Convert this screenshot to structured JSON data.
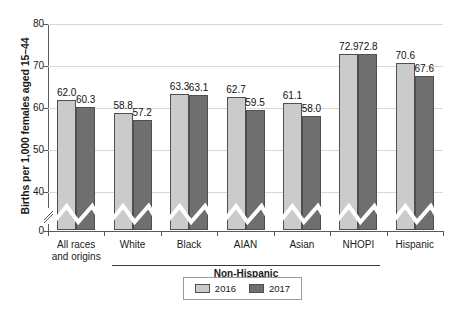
{
  "chart_data": {
    "type": "bar",
    "title": "",
    "xlabel": "",
    "ylabel": "Births per 1,000 females aged 15–44",
    "ylim": [
      0,
      80
    ],
    "yticks": [
      0,
      40,
      50,
      60,
      70,
      80
    ],
    "ytick_labels": [
      "0",
      "40",
      "50",
      "60",
      "70",
      "80"
    ],
    "axis_break": true,
    "axis_break_note": "y-axis broken between 0 and 40",
    "grid": true,
    "legend_position": "bottom-center",
    "categories": [
      "All races\nand origins",
      "White",
      "Black",
      "AIAN",
      "Asian",
      "NHOPI",
      "Hispanic"
    ],
    "category_labels": [
      "All races and origins",
      "White",
      "Black",
      "AIAN",
      "Asian",
      "NHOPI",
      "Hispanic"
    ],
    "group_bracket": {
      "label": "Non-Hispanic",
      "covers": [
        "White",
        "Black",
        "AIAN",
        "Asian",
        "NHOPI"
      ]
    },
    "series": [
      {
        "name": "2016",
        "color": "#cbcbcb",
        "values": [
          62.0,
          58.8,
          63.3,
          62.7,
          61.1,
          72.9,
          70.6
        ],
        "labels": [
          "62.0",
          "58.8",
          "63.3",
          "62.7",
          "61.1",
          "72.9",
          "70.6"
        ]
      },
      {
        "name": "2017",
        "color": "#6f6f6f",
        "values": [
          60.3,
          57.2,
          63.1,
          59.5,
          58.0,
          72.8,
          67.6
        ],
        "labels": [
          "60.3",
          "57.2",
          "63.1",
          "59.5",
          "58.0",
          "72.8",
          "67.6"
        ]
      }
    ]
  },
  "legend": {
    "items": [
      {
        "label": "2016",
        "color": "#cbcbcb"
      },
      {
        "label": "2017",
        "color": "#6f6f6f"
      }
    ]
  },
  "axis": {
    "y_title": "Births per 1,000 females aged 15–44",
    "y_tick_0": "0",
    "y_tick_40": "40",
    "y_tick_50": "50",
    "y_tick_60": "60",
    "y_tick_70": "70",
    "y_tick_80": "80"
  },
  "categories_display": {
    "c0_line1": "All races",
    "c0_line2": "and origins",
    "c1": "White",
    "c2": "Black",
    "c3": "AIAN",
    "c4": "Asian",
    "c5": "NHOPI",
    "c6": "Hispanic"
  },
  "bracket": {
    "label": "Non-Hispanic"
  },
  "colors": {
    "series_2016": "#cbcbcb",
    "series_2017": "#6f6f6f",
    "axis": "#5a5a5a",
    "grid": "#d8d8d8",
    "bar_outline": "#4f4f4f"
  }
}
